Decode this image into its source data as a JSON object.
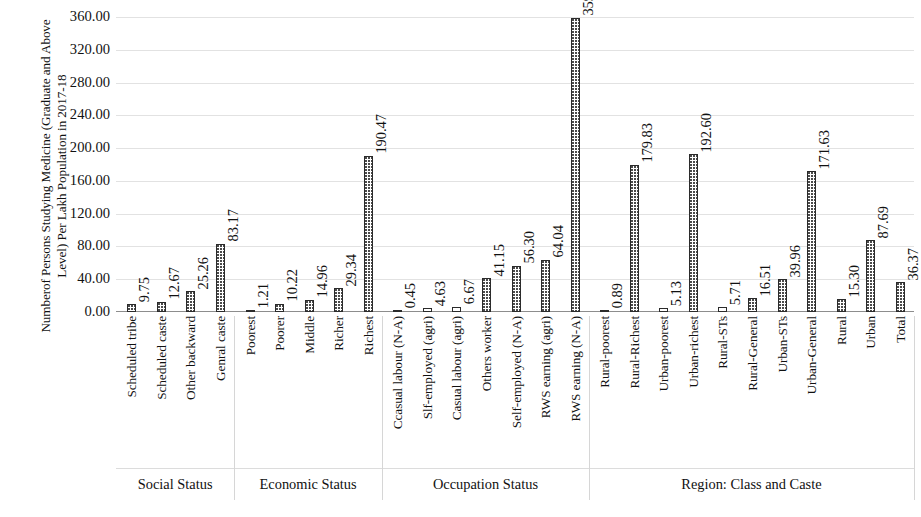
{
  "chart_data": {
    "type": "bar",
    "title": "",
    "xlabel": "",
    "ylabel": "Numberof Persons Studying Medicine (Graduate and Above Level) Per Lakh Population in 2017-18",
    "ylabel_line1": "Numberof Persons Studying Medicine (Graduate and Above",
    "ylabel_line2": "Level) Per Lakh Population in 2017-18",
    "ylim": [
      0,
      360
    ],
    "ytick_step": 40,
    "grid": true,
    "legend": "none",
    "value_label_format": "2 decimals",
    "yticks": [
      "360.00",
      "320.00",
      "280.00",
      "240.00",
      "200.00",
      "160.00",
      "120.00",
      "80.00",
      "40.00",
      "0.00"
    ],
    "categories": [
      "Scheduled tribe",
      "Scheduled caste",
      "Other backward",
      "Genral caste",
      "Poorest",
      "Poorer",
      "Middle",
      "Richer",
      "Richest",
      "Ccasual labour (N-A)",
      "Slf-employed (agri)",
      "Casual labour (agri)",
      "Others worker",
      "Self-employed (N-A)",
      "RWS earning (agri)",
      "RWS earning (N-A)",
      "Rural-poorest",
      "Rural-Richest",
      "Urban-poorest",
      "Urban-richest",
      "Rural-STs",
      "Rural-General",
      "Urban-STs",
      "Urban-General",
      "Rural",
      "Urban",
      "Total"
    ],
    "values": [
      9.75,
      12.67,
      25.26,
      83.17,
      1.21,
      10.22,
      14.96,
      29.34,
      190.47,
      0.45,
      4.63,
      6.67,
      41.15,
      56.3,
      64.04,
      359.08,
      0.89,
      179.83,
      5.13,
      192.6,
      5.71,
      16.51,
      39.96,
      171.63,
      15.3,
      87.69,
      36.37
    ],
    "value_labels": [
      "9.75",
      "12.67",
      "25.26",
      "83.17",
      "1.21",
      "10.22",
      "14.96",
      "29.34",
      "190.47",
      "0.45",
      "4.63",
      "6.67",
      "41.15",
      "56.30",
      "64.04",
      "359.08",
      "0.89",
      "179.83",
      "5.13",
      "192.60",
      "5.71",
      "16.51",
      "39.96",
      "171.63",
      "15.30",
      "87.69",
      "36.37"
    ],
    "groups": [
      {
        "label": "Social Status",
        "start_index": 0,
        "end_index": 3
      },
      {
        "label": "Economic Status",
        "start_index": 4,
        "end_index": 8
      },
      {
        "label": "Occupation Status",
        "start_index": 9,
        "end_index": 15
      },
      {
        "label": "Region: Class and Caste",
        "start_index": 16,
        "end_index": 26
      }
    ],
    "series_fill": "#ffffff",
    "series_edge": "#2b2b2b",
    "series_pattern": "fine dotted",
    "gridline_color": "#e2e2e2"
  }
}
